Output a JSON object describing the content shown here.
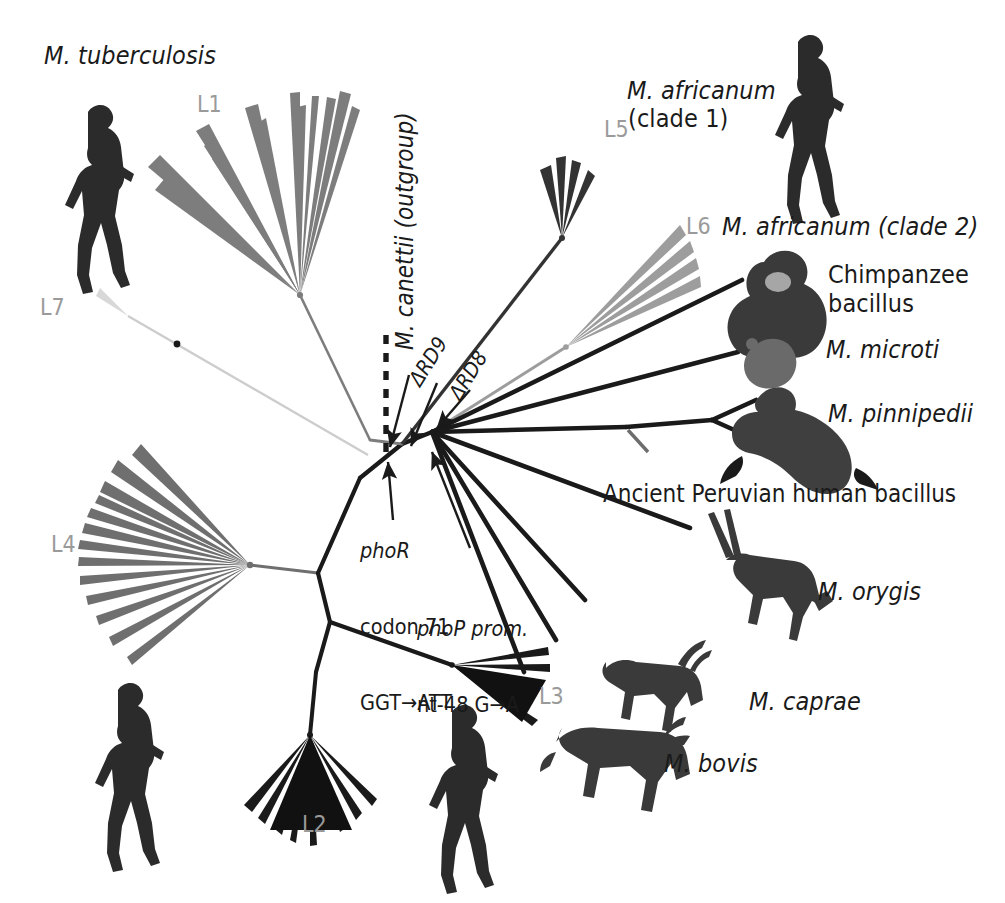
{
  "figure": {
    "kind": "unrooted-phylogenetic-tree",
    "organism_complex": "Mycobacterium tuberculosis complex",
    "title_human_adapted": "M. tuberculosis",
    "outgroup_label": "M. canettii (outgroup)"
  },
  "labels": {
    "m_tuberculosis": "M. tuberculosis",
    "m_africanum_clade1_line1": "M. africanum",
    "m_africanum_clade1_line2": "(clade 1)",
    "m_africanum_clade2": "M. africanum (clade 2)",
    "chimpanzee_line1": "Chimpanzee",
    "chimpanzee_line2": "bacillus",
    "m_microti": "M. microti",
    "m_pinnipedii": "M. pinnipedii",
    "ancient_peruvian": "Ancient Peruvian human bacillus",
    "m_orygis": "M. orygis",
    "m_caprae": "M. caprae",
    "m_bovis": "M. bovis",
    "m_canettii_outgroup": "M. canettii (outgroup)"
  },
  "lineages": [
    {
      "id": "L1",
      "label": "L1",
      "color": "#7d7d7d"
    },
    {
      "id": "L2",
      "label": "L2",
      "color": "#1a1a1a"
    },
    {
      "id": "L3",
      "label": "L3",
      "color": "#1a1a1a"
    },
    {
      "id": "L4",
      "label": "L4",
      "color": "#6f6f6f"
    },
    {
      "id": "L5",
      "label": "L5",
      "color": "#3a3a3a"
    },
    {
      "id": "L6",
      "label": "L6",
      "color": "#9d9d9d"
    },
    {
      "id": "L7",
      "label": "L7",
      "color": "#c9c9c9"
    }
  ],
  "deletions": [
    {
      "id": "RD9",
      "label": "ΔRD9"
    },
    {
      "id": "RD8",
      "label": "ΔRD8"
    }
  ],
  "mutations": [
    {
      "id": "phoR",
      "gene": "phoR",
      "line2": "codon 71",
      "line3": "GGT→ATT"
    },
    {
      "id": "phoP",
      "gene": "phoP prom.",
      "line2": "nt-48 G→A"
    }
  ],
  "animal_icons": [
    {
      "name": "walking-human-upper-left",
      "species": "human"
    },
    {
      "name": "walking-human-upper-right",
      "species": "human"
    },
    {
      "name": "walking-human-lower-left",
      "species": "human"
    },
    {
      "name": "walking-human-lower-center",
      "species": "human"
    },
    {
      "name": "chimpanzee",
      "species": "chimpanzee"
    },
    {
      "name": "vole",
      "species": "vole"
    },
    {
      "name": "seal",
      "species": "seal"
    },
    {
      "name": "oryx",
      "species": "oryx"
    },
    {
      "name": "goat",
      "species": "goat"
    },
    {
      "name": "cow",
      "species": "cow"
    }
  ],
  "colors": {
    "background": "#ffffff",
    "ink": "#1a1a1a",
    "grey_mid": "#7d7d7d",
    "grey_light": "#c9c9c9",
    "lineage_tag": "#9a9a9a"
  }
}
